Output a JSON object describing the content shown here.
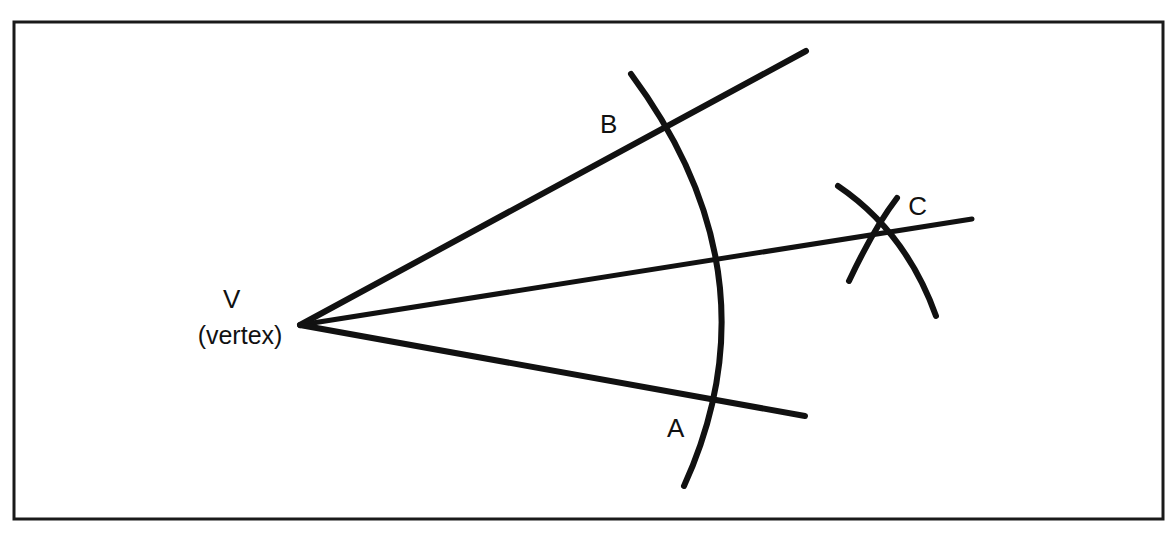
{
  "figure": {
    "background_color": "#ffffff",
    "ink_color": "#111111",
    "frame": {
      "name": "border-frame",
      "x": 14,
      "y": 22,
      "width": 1149,
      "height": 497,
      "stroke_width": 3
    },
    "vertex": {
      "point_label": "V",
      "descriptor": "(vertex)",
      "x": 300,
      "y": 325
    },
    "labels": [
      {
        "id": "A",
        "text": "A",
        "x": 668,
        "y": 437
      },
      {
        "id": "B",
        "text": "B",
        "x": 609,
        "y": 133
      },
      {
        "id": "C",
        "text": "C",
        "x": 909,
        "y": 215
      },
      {
        "id": "V",
        "text": "V",
        "x": 232,
        "y": 308
      },
      {
        "id": "vertex-descriptor",
        "text": "(vertex)",
        "x": 196,
        "y": 344
      }
    ],
    "rays": [
      {
        "id": "upper-ray",
        "name": "ray-vb",
        "from_x": 300,
        "from_y": 325,
        "to_x": 806,
        "to_y": 51,
        "stroke_width": 6
      },
      {
        "id": "middle-ray",
        "name": "ray-vc-bisector",
        "from_x": 300,
        "from_y": 325,
        "to_x": 972,
        "to_y": 219,
        "stroke_width": 5
      },
      {
        "id": "lower-ray",
        "name": "ray-va",
        "from_x": 300,
        "from_y": 325,
        "to_x": 805,
        "to_y": 416,
        "stroke_width": 6
      }
    ],
    "arcs": [
      {
        "id": "main-arc",
        "name": "arc-from-vertex",
        "description": "Large arc centered at vertex crossing both rays at A and B",
        "start_x": 631,
        "start_y": 74,
        "ctrl_x": 780,
        "ctrl_y": 275,
        "end_x": 684,
        "end_y": 486,
        "stroke_width": 6
      },
      {
        "id": "arc-from-a",
        "name": "arc-from-point-a",
        "description": "Small arc swung from A crossing at C, sweeping down-right",
        "start_x": 838,
        "start_y": 186,
        "ctrl_x": 906,
        "ctrl_y": 232,
        "end_x": 936,
        "end_y": 316,
        "stroke_width": 6
      },
      {
        "id": "arc-from-b",
        "name": "arc-from-point-b",
        "description": "Small arc swung from B crossing at C, sweeping down-left",
        "start_x": 897,
        "start_y": 198,
        "ctrl_x": 874,
        "ctrl_y": 228,
        "end_x": 849,
        "end_y": 281,
        "stroke_width": 6
      }
    ],
    "intersection_points": [
      {
        "id": "point-a",
        "label": "A",
        "x": 700,
        "y": 406
      },
      {
        "id": "point-b",
        "label": "B",
        "x": 661,
        "y": 124
      },
      {
        "id": "point-c",
        "label": "C",
        "x": 880,
        "y": 233
      }
    ]
  }
}
